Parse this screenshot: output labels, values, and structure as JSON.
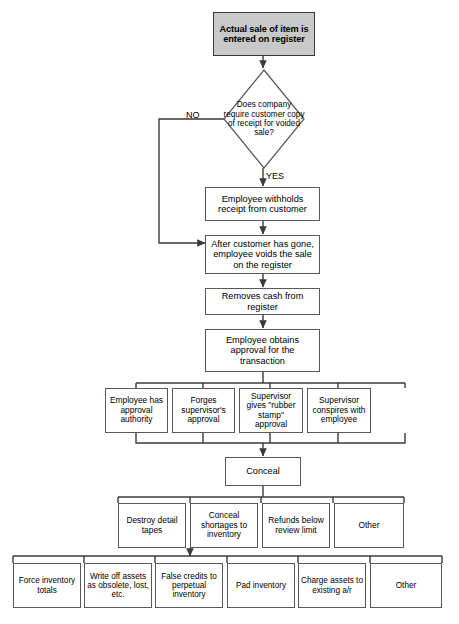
{
  "diagram": {
    "type": "flowchart",
    "colors": {
      "start_fill": "#c9c9c9",
      "box_fill": "#ffffff",
      "line": "#3a3a3a",
      "border": "#58585a"
    },
    "start": {
      "label": "Actual sale of item is entered on register"
    },
    "decision": {
      "label": "Does company require customer copy of receipt for voided sale?",
      "branch_no": "NO",
      "branch_yes": "YES"
    },
    "steps": [
      {
        "label": "Employee withholds receipt from customer"
      },
      {
        "label": "After customer has gone, employee voids the sale on the register"
      },
      {
        "label": "Removes cash from register"
      },
      {
        "label": "Employee obtains approval for the transaction"
      }
    ],
    "approval_row": [
      {
        "label": "Employee has approval authority"
      },
      {
        "label": "Forges supervisor's approval"
      },
      {
        "label": "Supervisor gives \"rubber stamp\" approval"
      },
      {
        "label": "Supervisor conspires with employee"
      }
    ],
    "conceal": {
      "label": "Conceal"
    },
    "conceal_row": [
      {
        "label": "Destroy detail tapes"
      },
      {
        "label": "Conceal shortages to inventory"
      },
      {
        "label": "Refunds below review limit"
      },
      {
        "label": "Other"
      }
    ],
    "inventory_row": [
      {
        "label": "Force inventory totals"
      },
      {
        "label": "Write off assets as obsolete, lost, etc."
      },
      {
        "label": "False credits to perpetual inventory"
      },
      {
        "label": "Pad inventory"
      },
      {
        "label": "Charge assets to existing a/r"
      },
      {
        "label": "Other"
      }
    ]
  }
}
